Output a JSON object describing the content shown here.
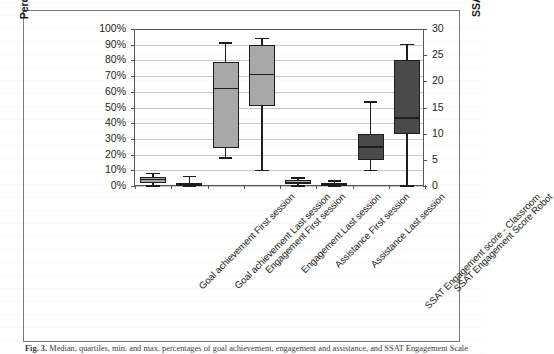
{
  "figure": {
    "caption_prefix": "Fig. 3.",
    "caption_text": "Median, quartiles, min. and max. percentages of goal achievement, engagement and assistance, and SSAT Engagement Scale scores"
  },
  "chart_data": {
    "type": "box",
    "title": "",
    "xlabel": "",
    "ylabel": "Percentage",
    "y2label": "SSAT EngagementScale score",
    "ylim": [
      0,
      100
    ],
    "y2lim": [
      0,
      30
    ],
    "grid": true,
    "legend": "none",
    "ytick_labels": [
      "100%",
      "90%",
      "80%",
      "70%",
      "60%",
      "50%",
      "40%",
      "30%",
      "20%",
      "10%",
      "0%"
    ],
    "y2tick_labels": [
      "30",
      "25",
      "20",
      "15",
      "10",
      "5",
      "0"
    ],
    "categories": [
      "Goal achievement First session",
      "Goal achievement  Last session",
      "Engagement First session",
      "Engagement Last session",
      "Assistance First session",
      "Assistance Last session",
      "SSAT Engagement score - Classroom",
      "SSAT Engagement  Score Robot"
    ],
    "colors": {
      "light_box": "#a8a8a8",
      "dark_box": "#4a4a4a",
      "outline": "#1d1d1d",
      "gridline": "#c9c9c9",
      "axis": "#555555",
      "frame": "#7b7b7b"
    },
    "boxes": [
      {
        "label": "Goal achievement First session",
        "axis": "left",
        "fill": "light",
        "min": 0,
        "q1": 2,
        "median": 4,
        "q3": 6,
        "max": 8
      },
      {
        "label": "Goal achievement  Last session",
        "axis": "left",
        "fill": "dark",
        "min": 0,
        "q1": 0,
        "median": 1,
        "q3": 2,
        "max": 6
      },
      {
        "label": "Engagement First session",
        "axis": "left",
        "fill": "light",
        "min": 18,
        "q1": 24,
        "median": 62,
        "q3": 79,
        "max": 91
      },
      {
        "label": "Engagement Last session",
        "axis": "left",
        "fill": "light",
        "min": 10,
        "q1": 51,
        "median": 71,
        "q3": 90,
        "max": 94
      },
      {
        "label": "Assistance First session",
        "axis": "left",
        "fill": "light",
        "min": 0,
        "q1": 1,
        "median": 2,
        "q3": 4,
        "max": 5
      },
      {
        "label": "Assistance Last session",
        "axis": "left",
        "fill": "dark",
        "min": 0,
        "q1": 0,
        "median": 1,
        "q3": 2,
        "max": 3
      },
      {
        "label": "SSAT Engagement score - Classroom",
        "axis": "right",
        "fill": "dark",
        "min": 3,
        "q1": 5,
        "median": 7.5,
        "q3": 10,
        "max": 16
      },
      {
        "label": "SSAT Engagement  Score Robot",
        "axis": "right",
        "fill": "dark",
        "min": 0,
        "q1": 10,
        "median": 13,
        "q3": 24,
        "max": 27
      }
    ]
  }
}
